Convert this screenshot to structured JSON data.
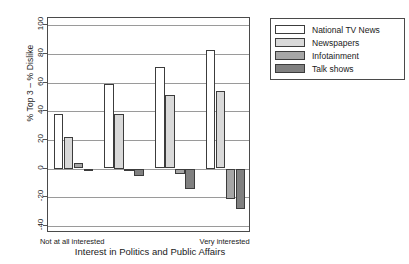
{
  "chart_data": {
    "type": "bar",
    "title": "",
    "xlabel": "Interest in Politics and Public Affairs",
    "ylabel": "% Top 3 – % Dislike",
    "categories": [
      "Not at all interested",
      "2",
      "3",
      "Very interested"
    ],
    "xtick_labels": [
      "Not at all interested",
      "Very interested"
    ],
    "ylim": [
      -45,
      105
    ],
    "yticks": [
      -40,
      -20,
      0,
      20,
      40,
      60,
      80,
      100
    ],
    "ytick_labels": [
      "-40",
      "-20",
      "0",
      "20",
      "40",
      "60",
      "80",
      "100"
    ],
    "grid": true,
    "legend_position": "upper right",
    "series": [
      {
        "name": "National TV News",
        "color": "#ffffff",
        "values": [
          38,
          59,
          71,
          83
        ]
      },
      {
        "name": "Newspapers",
        "color": "#d9d9d9",
        "values": [
          22,
          38,
          51,
          54
        ]
      },
      {
        "name": "Infotainment",
        "color": "#a6a6a6",
        "values": [
          4,
          -2,
          -4,
          -21
        ]
      },
      {
        "name": "Talk shows",
        "color": "#808080",
        "values": [
          -1,
          -5,
          -14,
          -28
        ]
      }
    ]
  },
  "legend": {
    "items": [
      {
        "label": "National TV News",
        "color": "#ffffff"
      },
      {
        "label": "Newspapers",
        "color": "#d9d9d9"
      },
      {
        "label": "Infotainment",
        "color": "#a6a6a6"
      },
      {
        "label": "Talk shows",
        "color": "#808080"
      }
    ]
  }
}
